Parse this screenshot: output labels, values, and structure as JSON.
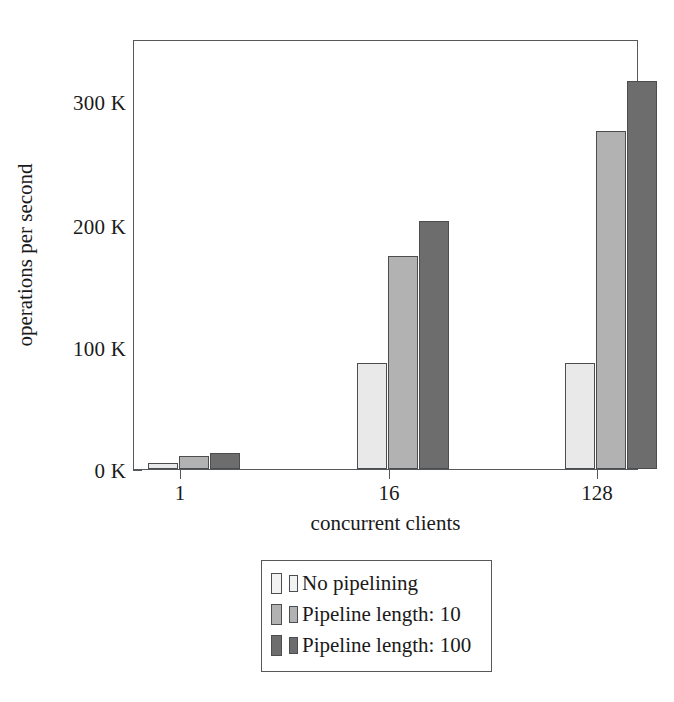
{
  "chart_data": {
    "type": "bar",
    "title": "",
    "subtitle": "",
    "xlabel": "concurrent clients",
    "ylabel": "operations per second",
    "categories": [
      "1",
      "16",
      "128"
    ],
    "xtick_labels": [
      "1",
      "16",
      "128"
    ],
    "ytick_labels": [
      "0 K",
      "100 K",
      "200 K",
      "300 K"
    ],
    "ytick_values": [
      0,
      100000,
      200000,
      300000
    ],
    "ylim": [
      0,
      352000
    ],
    "y_unit": "K",
    "grid": false,
    "legend_position": "below-axes",
    "series": [
      {
        "name": "No pipelining",
        "color": "#e9e9e9",
        "values": [
          5000,
          87000,
          87000
        ],
        "value_labels": [
          "5 K",
          "87 K",
          "87 K"
        ]
      },
      {
        "name": "Pipeline length: 10",
        "color": "#b2b2b2",
        "values": [
          11000,
          175000,
          278000
        ],
        "value_labels": [
          "11 K",
          "175 K",
          "278 K"
        ]
      },
      {
        "name": "Pipeline length: 100",
        "color": "#6d6d6d",
        "values": [
          13000,
          204000,
          319000
        ],
        "value_labels": [
          "13 K",
          "204 K",
          "319 K"
        ]
      }
    ],
    "legend_entries": [
      "No pipelining",
      "Pipeline length: 10",
      "Pipeline length: 100"
    ],
    "axis_color": "#55595c",
    "bar_border_color": "#4a4e51",
    "background": "#ffffff"
  }
}
